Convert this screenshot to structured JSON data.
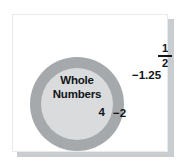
{
  "diagram": {
    "outer_set": {
      "name": "integers-ring",
      "member_label": "−2",
      "color": "#a5a9ac"
    },
    "inner_set": {
      "name": "whole-numbers",
      "label_line1": "Whole",
      "label_line2": "Numbers",
      "member_label": "4",
      "color": "#d9dbdc"
    },
    "outside_labels": {
      "fraction_numerator": "1",
      "fraction_denominator": "2",
      "decimal": "−1.25"
    },
    "panel": {
      "background": "#ffffff",
      "shadow_color": "#c9cdd0",
      "border_color": "#e8eaec"
    }
  }
}
